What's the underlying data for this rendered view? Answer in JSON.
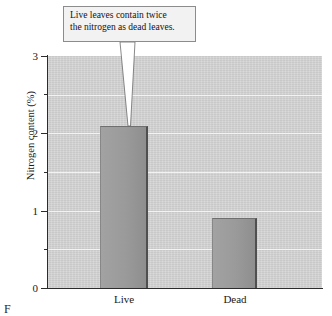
{
  "chart_data": {
    "type": "bar",
    "title": "",
    "subtitle": "",
    "categories": [
      "Live",
      "Dead"
    ],
    "values": [
      2.1,
      0.9
    ],
    "series": [
      {
        "name": "Nitrogen content",
        "values": [
          2.1,
          0.9
        ]
      }
    ],
    "xlabel": "",
    "ylabel": "Nitrogen content (%)",
    "ylim": [
      0,
      3
    ],
    "xlim_note": "categorical",
    "y_ticks": [
      0,
      1,
      2,
      3
    ],
    "y_tick_labels": [
      "0",
      "1",
      "2",
      "3"
    ],
    "y_minor_gridlines": [
      0.5,
      1.0,
      1.5,
      2.0,
      2.5
    ],
    "grid": true,
    "grid_orientation": "horizontal",
    "legend": false,
    "legend_position": "none",
    "annotations": [
      {
        "text": "Live leaves contain twice the nitrogen as dead leaves.",
        "points_to_category": "Live",
        "points_to_value": 2.1
      }
    ],
    "colors": {
      "bar_fill": "#9a9a9a",
      "bar_edge": "#4f4f4f",
      "plot_background": "#d6d6d6",
      "gridline": "#f4f4f4",
      "axis": "#2c2c2c",
      "callout_background": "#f2f2f2",
      "callout_border": "#8c8c8c",
      "text": "#1a1a1a"
    }
  },
  "axes": {
    "y_title": "Nitrogen content (%)",
    "y_ticks": [
      {
        "label": "3",
        "value": 3
      },
      {
        "label": "2",
        "value": 2
      },
      {
        "label": "1",
        "value": 1
      },
      {
        "label": "0",
        "value": 0
      }
    ],
    "x_ticks": [
      {
        "label": "Live"
      },
      {
        "label": "Dead"
      }
    ]
  },
  "callout": {
    "line1": "Live leaves contain twice",
    "line2": "the nitrogen as dead leaves.",
    "full_text": "Live leaves contain twice the nitrogen as dead leaves."
  },
  "caption": {
    "text": "F"
  }
}
